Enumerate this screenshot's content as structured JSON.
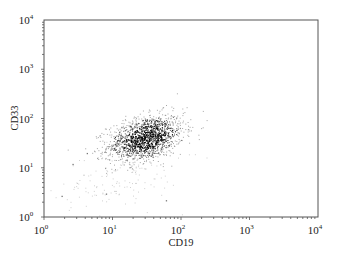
{
  "chart_data": {
    "type": "scatter",
    "title": "",
    "xlabel": "CD19",
    "ylabel": "CD33",
    "xscale": "log",
    "yscale": "log",
    "xlim": [
      1,
      10000
    ],
    "ylim": [
      1,
      10000
    ],
    "grid": false,
    "legend": null,
    "x_ticks": [
      {
        "value": 1,
        "base": "10",
        "exp": "0"
      },
      {
        "value": 10,
        "base": "10",
        "exp": "1"
      },
      {
        "value": 100,
        "base": "10",
        "exp": "2"
      },
      {
        "value": 1000,
        "base": "10",
        "exp": "3"
      },
      {
        "value": 10000,
        "base": "10",
        "exp": "4"
      }
    ],
    "y_ticks": [
      {
        "value": 1,
        "base": "10",
        "exp": "0"
      },
      {
        "value": 10,
        "base": "10",
        "exp": "1"
      },
      {
        "value": 100,
        "base": "10",
        "exp": "2"
      },
      {
        "value": 1000,
        "base": "10",
        "exp": "3"
      },
      {
        "value": 10000,
        "base": "10",
        "exp": "4"
      }
    ],
    "series": [
      {
        "name": "main population",
        "description": "dense cluster of events",
        "center": {
          "x": 30,
          "y": 40
        },
        "spread_log10": {
          "x": 0.28,
          "y": 0.24
        },
        "correlation": 0.35,
        "approx_extent": {
          "x": [
            6,
            140
          ],
          "y": [
            8,
            150
          ]
        },
        "n_points": 1400,
        "color": "#000000"
      },
      {
        "name": "background events",
        "description": "sparse low-intensity events",
        "center": {
          "x": 12,
          "y": 6
        },
        "spread_log10": {
          "x": 0.45,
          "y": 0.4
        },
        "correlation": 0.4,
        "approx_extent": {
          "x": [
            1.5,
            100
          ],
          "y": [
            1,
            40
          ]
        },
        "n_points": 140,
        "color": "#9a9a9a"
      }
    ],
    "outliers": [
      {
        "x": 1.8,
        "y": 2.7
      },
      {
        "x": 4.2,
        "y": 20
      },
      {
        "x": 2.6,
        "y": 12
      },
      {
        "x": 8,
        "y": 3
      },
      {
        "x": 60,
        "y": 2.2
      }
    ]
  },
  "layout": {
    "plot_left": 44,
    "plot_top": 20,
    "plot_right": 318,
    "plot_bottom": 217,
    "axis_color": "#555555"
  }
}
